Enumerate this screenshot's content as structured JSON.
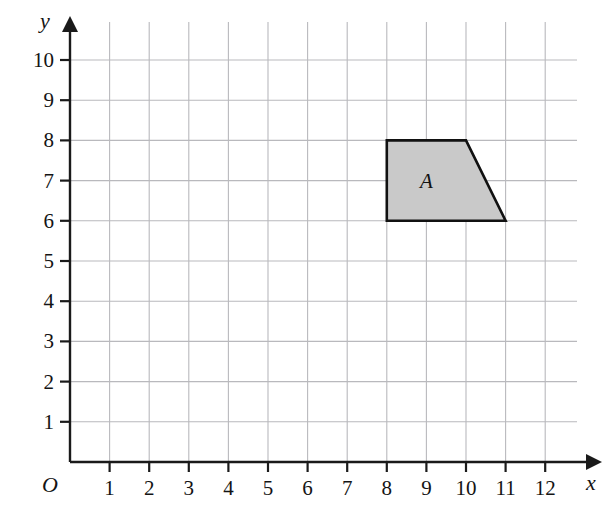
{
  "figure": {
    "background_color": "#ffffff",
    "grid_color": "#b9b9bd",
    "axis_color": "#1a1a1a",
    "shape_fill_color": "#c9c9c9",
    "shape_stroke_color": "#111111"
  },
  "axes": {
    "x": {
      "name": "x",
      "tick_labels": [
        "1",
        "2",
        "3",
        "4",
        "5",
        "6",
        "7",
        "8",
        "9",
        "10",
        "11",
        "12"
      ],
      "ticks": [
        1,
        2,
        3,
        4,
        5,
        6,
        7,
        8,
        9,
        10,
        11,
        12
      ],
      "range": [
        0,
        13
      ],
      "arrow": true
    },
    "y": {
      "name": "y",
      "tick_labels": [
        "1",
        "2",
        "3",
        "4",
        "5",
        "6",
        "7",
        "8",
        "9",
        "10"
      ],
      "ticks": [
        1,
        2,
        3,
        4,
        5,
        6,
        7,
        8,
        9,
        10
      ],
      "range": [
        0,
        10.8
      ],
      "arrow": true
    },
    "origin_label": "O"
  },
  "chart_data": {
    "type": "scatter",
    "title": "",
    "xlabel": "x",
    "ylabel": "y",
    "xlim": [
      0,
      13
    ],
    "ylim": [
      0,
      10.8
    ],
    "grid": true,
    "grid_spacing": 1,
    "legend": "none",
    "shapes": [
      {
        "label": "A",
        "kind": "quadrilateral",
        "vertices": [
          [
            8,
            8
          ],
          [
            10,
            8
          ],
          [
            11,
            6
          ],
          [
            8,
            6
          ]
        ],
        "label_position": [
          9,
          7
        ],
        "filled": true
      }
    ]
  }
}
